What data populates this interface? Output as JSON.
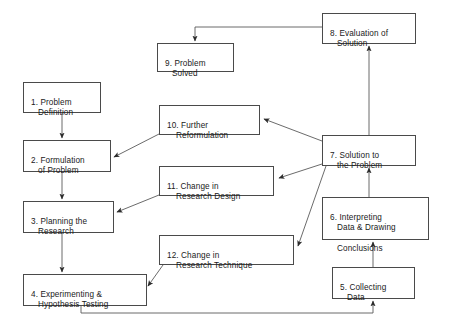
{
  "diagram": {
    "background_color": "#ffffff",
    "box_border_color": "#4a4a4a",
    "text_color": "#1a1a1a",
    "arrow_color": "#4a4a4a"
  },
  "nodes": [
    {
      "id": "node-1",
      "number": "1.",
      "line1": "1. Problem",
      "line2": "Definition",
      "x": 23,
      "y": 82,
      "w": 78,
      "h": 31
    },
    {
      "id": "node-2",
      "number": "2.",
      "line1": "2. Formulation",
      "line2": "of Problem",
      "x": 23,
      "y": 140,
      "w": 88,
      "h": 32
    },
    {
      "id": "node-3",
      "number": "3.",
      "line1": "3. Planning the",
      "line2": "Research",
      "x": 23,
      "y": 201,
      "w": 91,
      "h": 32
    },
    {
      "id": "node-4",
      "number": "4.",
      "line1": "4. Experimenting &",
      "line2": "Hypothesis Testing",
      "x": 23,
      "y": 274,
      "w": 124,
      "h": 32
    },
    {
      "id": "node-5",
      "number": "5.",
      "line1": "5. Collecting",
      "line2": "Data",
      "x": 332,
      "y": 267,
      "w": 83,
      "h": 32
    },
    {
      "id": "node-6",
      "number": "6.",
      "line1": "6. Interpreting",
      "line2": "Data & Drawing",
      "line3": "Conclusions",
      "x": 322,
      "y": 197,
      "w": 107,
      "h": 43
    },
    {
      "id": "node-7",
      "number": "7.",
      "line1": "7. Solution to",
      "line2": "the Problem",
      "x": 322,
      "y": 135,
      "w": 94,
      "h": 31
    },
    {
      "id": "node-8",
      "number": "8.",
      "line1": "8. Evaluation of",
      "line2": "Solution",
      "x": 322,
      "y": 13,
      "w": 94,
      "h": 31
    },
    {
      "id": "node-9",
      "number": "9.",
      "line1": "9. Problem",
      "line2": "Solved",
      "x": 157,
      "y": 43,
      "w": 77,
      "h": 29
    },
    {
      "id": "node-10",
      "number": "10.",
      "line1": "10. Further",
      "line2": "Reformulation",
      "x": 159,
      "y": 105,
      "w": 101,
      "h": 30
    },
    {
      "id": "node-11",
      "number": "11.",
      "line1": "11. Change in",
      "line2": "Research Design",
      "x": 159,
      "y": 166,
      "w": 115,
      "h": 30
    },
    {
      "id": "node-12",
      "number": "12.",
      "line1": "12. Change in",
      "line2": "Research Technique",
      "x": 159,
      "y": 235,
      "w": 135,
      "h": 30
    }
  ],
  "edges": [
    {
      "id": "edge-1-to-2",
      "from": "node-1",
      "to": "node-2",
      "kind": "straight-down"
    },
    {
      "id": "edge-2-to-3",
      "from": "node-2",
      "to": "node-3",
      "kind": "straight-down"
    },
    {
      "id": "edge-3-to-4",
      "from": "node-3",
      "to": "node-4",
      "kind": "straight-down"
    },
    {
      "id": "edge-4-to-5",
      "from": "node-4",
      "to": "node-5",
      "kind": "elbow-bottom-loop"
    },
    {
      "id": "edge-5-to-6",
      "from": "node-5",
      "to": "node-6",
      "kind": "straight-up"
    },
    {
      "id": "edge-6-to-7",
      "from": "node-6",
      "to": "node-7",
      "kind": "straight-up"
    },
    {
      "id": "edge-7-to-8",
      "from": "node-7",
      "to": "node-8",
      "kind": "straight-up"
    },
    {
      "id": "edge-8-to-9",
      "from": "node-8",
      "to": "node-9",
      "kind": "elbow-top-left"
    },
    {
      "id": "edge-7-to-10",
      "from": "node-7",
      "to": "node-10",
      "kind": "diagonal"
    },
    {
      "id": "edge-7-to-11",
      "from": "node-7",
      "to": "node-11",
      "kind": "diagonal"
    },
    {
      "id": "edge-7-to-12",
      "from": "node-7",
      "to": "node-12",
      "kind": "diagonal"
    },
    {
      "id": "edge-10-to-2",
      "from": "node-10",
      "to": "node-2",
      "kind": "diagonal"
    },
    {
      "id": "edge-11-to-3",
      "from": "node-11",
      "to": "node-3",
      "kind": "diagonal"
    },
    {
      "id": "edge-12-to-4",
      "from": "node-12",
      "to": "node-4",
      "kind": "diagonal"
    }
  ]
}
